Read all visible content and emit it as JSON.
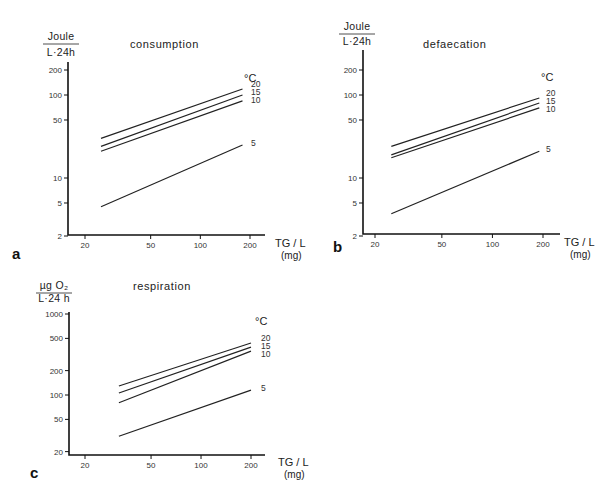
{
  "chart_data": [
    {
      "panel": "a",
      "type": "line",
      "title": "consumption",
      "ylabel_num": "Joule",
      "ylabel_den": "L·24h",
      "xlabel": "TG / L",
      "xlabel_unit": "(mg)",
      "xscale": "log",
      "yscale": "log",
      "xticks": [
        20,
        50,
        100,
        200
      ],
      "yticks": [
        2,
        5,
        10,
        50,
        100,
        200
      ],
      "xlim": [
        17,
        240
      ],
      "ylim": [
        2,
        260
      ],
      "legend_title": "°C",
      "grid": false,
      "series": [
        {
          "name": "20",
          "x": [
            25,
            180
          ],
          "y": [
            30,
            118
          ]
        },
        {
          "name": "15",
          "x": [
            25,
            180
          ],
          "y": [
            24,
            100
          ]
        },
        {
          "name": "10",
          "x": [
            25,
            180
          ],
          "y": [
            21,
            85
          ]
        },
        {
          "name": "5",
          "x": [
            25,
            180
          ],
          "y": [
            4.5,
            25
          ]
        }
      ]
    },
    {
      "panel": "b",
      "type": "line",
      "title": "defaecation",
      "ylabel_num": "Joule",
      "ylabel_den": "L·24h",
      "xlabel": "TG / L",
      "xlabel_unit": "(mg)",
      "xscale": "log",
      "yscale": "log",
      "xticks": [
        20,
        50,
        100,
        200
      ],
      "yticks": [
        2,
        5,
        10,
        50,
        100,
        200
      ],
      "xlim": [
        17,
        240
      ],
      "ylim": [
        2,
        330
      ],
      "legend_title": "°C",
      "grid": false,
      "series": [
        {
          "name": "20",
          "x": [
            25,
            190
          ],
          "y": [
            24,
            92
          ]
        },
        {
          "name": "15",
          "x": [
            25,
            190
          ],
          "y": [
            19,
            80
          ]
        },
        {
          "name": "10",
          "x": [
            25,
            190
          ],
          "y": [
            17.5,
            70
          ]
        },
        {
          "name": "5",
          "x": [
            25,
            190
          ],
          "y": [
            3.7,
            21
          ]
        }
      ]
    },
    {
      "panel": "c",
      "type": "line",
      "title": "respiration",
      "ylabel_num": "µg O₂",
      "ylabel_den": "L·24 h",
      "xlabel": "TG / L",
      "xlabel_unit": "(mg)",
      "xscale": "log",
      "yscale": "log",
      "xticks": [
        20,
        50,
        100,
        200
      ],
      "yticks": [
        20,
        50,
        100,
        200,
        500,
        1000
      ],
      "xlim": [
        17,
        240
      ],
      "ylim": [
        20,
        1000
      ],
      "legend_title": "°C",
      "grid": false,
      "series": [
        {
          "name": "20",
          "x": [
            32,
            200
          ],
          "y": [
            129,
            438
          ]
        },
        {
          "name": "15",
          "x": [
            32,
            200
          ],
          "y": [
            106,
            390
          ]
        },
        {
          "name": "10",
          "x": [
            32,
            200
          ],
          "y": [
            80,
            348
          ]
        },
        {
          "name": "5",
          "x": [
            32,
            200
          ],
          "y": [
            31,
            115
          ]
        }
      ]
    }
  ],
  "layout": [
    {
      "x0": 68,
      "xAxisY": 235,
      "xEnd": 265,
      "yTop": 62,
      "x20": 85,
      "xPxDec": 165,
      "y100": 95,
      "yPxDec": 83,
      "yRef": 100,
      "titleX": 130,
      "titleY": 48,
      "unitX": 47,
      "unitNumY": 40,
      "unitDenY": 56,
      "degX": 244,
      "degY": 82,
      "lblX": 251,
      "letterX": 12,
      "letterY": 259,
      "xlabX": 275,
      "xlabY": 247
    },
    {
      "x0": 363,
      "xAxisY": 234,
      "xEnd": 560,
      "yTop": 50,
      "x20": 375,
      "xPxDec": 168,
      "y100": 95,
      "yPxDec": 83,
      "yRef": 100,
      "titleX": 423,
      "titleY": 48,
      "unitX": 343,
      "unitNumY": 30,
      "unitDenY": 45,
      "degX": 541,
      "degY": 81,
      "lblX": 546,
      "letterX": 333,
      "letterY": 252,
      "xlabX": 564,
      "xlabY": 246
    },
    {
      "x0": 69,
      "xAxisY": 455,
      "xEnd": 265,
      "yTop": 312,
      "x20": 85,
      "xPxDec": 166,
      "y100": 395,
      "yPxDec": 81,
      "yRef": 100,
      "titleX": 133,
      "titleY": 290,
      "unitX": 40,
      "unitNumY": 289,
      "unitDenY": 302,
      "degX": 255,
      "degY": 325,
      "lblX": 261,
      "letterX": 30,
      "letterY": 478,
      "xlabX": 278,
      "xlabY": 466
    }
  ]
}
